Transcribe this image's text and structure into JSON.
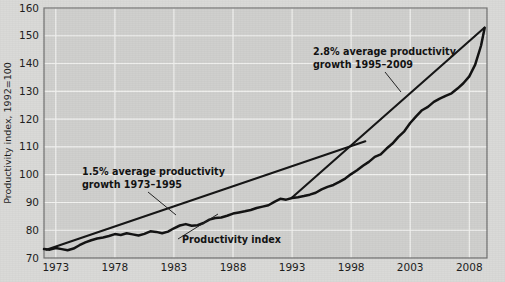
{
  "figure": {
    "background_color": "#d5d5d3",
    "plot_background_color": "#cfcfcd",
    "gridline_color": "#f2f2f0",
    "border_color": "#6f6f6f",
    "line_color": "#111111"
  },
  "axis": {
    "y_title": "Productivity index, 1992=100",
    "y_ticks": [
      "70",
      "80",
      "90",
      "100",
      "110",
      "120",
      "130",
      "140",
      "150",
      "160"
    ],
    "x_ticks": [
      "1973",
      "1978",
      "1983",
      "1988",
      "1993",
      "1998",
      "2003",
      "2008"
    ]
  },
  "annotations": {
    "trend1_line1": "1.5% average productivity",
    "trend1_line2": "growth 1973–1995",
    "trend2_line1": "2.8% average productivity",
    "trend2_line2": "growth 1995–2009",
    "series_label": "Productivity index"
  },
  "chart_data": {
    "type": "line",
    "title": "",
    "xlabel": "",
    "ylabel": "Productivity index, 1992=100",
    "xlim": [
      1972,
      2009.5
    ],
    "ylim": [
      70,
      160
    ],
    "ytick_values": [
      70,
      80,
      90,
      100,
      110,
      120,
      130,
      140,
      150,
      160
    ],
    "xtick_values": [
      1973,
      1978,
      1983,
      1988,
      1993,
      1998,
      2003,
      2008
    ],
    "grid": true,
    "legend_position": "none",
    "series": [
      {
        "name": "Productivity index",
        "type": "line",
        "x": [
          1972,
          1972.5,
          1973,
          1973.5,
          1974,
          1974.5,
          1975,
          1975.5,
          1976,
          1976.5,
          1977,
          1977.5,
          1978,
          1978.5,
          1979,
          1979.5,
          1980,
          1980.5,
          1981,
          1981.5,
          1982,
          1982.5,
          1983,
          1983.5,
          1984,
          1984.5,
          1985,
          1985.5,
          1986,
          1986.5,
          1987,
          1987.5,
          1988,
          1988.5,
          1989,
          1989.5,
          1990,
          1990.5,
          1991,
          1991.5,
          1992,
          1992.5,
          1993,
          1993.5,
          1994,
          1994.5,
          1995,
          1995.5,
          1996,
          1996.5,
          1997,
          1997.5,
          1998,
          1998.5,
          1999,
          1999.5,
          2000,
          2000.5,
          2001,
          2001.5,
          2002,
          2002.5,
          2003,
          2003.5,
          2004,
          2004.5,
          2005,
          2005.5,
          2006,
          2006.5,
          2007,
          2007.5,
          2008,
          2008.5,
          2009,
          2009.3
        ],
        "y": [
          73.2,
          73.0,
          73.6,
          73.2,
          72.8,
          73.4,
          74.6,
          75.6,
          76.4,
          77.0,
          77.4,
          77.9,
          78.6,
          78.3,
          78.9,
          78.5,
          78.1,
          78.7,
          79.6,
          79.4,
          78.9,
          79.5,
          80.7,
          81.7,
          82.2,
          81.6,
          81.8,
          82.6,
          83.8,
          84.4,
          84.6,
          85.2,
          86.0,
          86.4,
          86.8,
          87.3,
          88.0,
          88.5,
          89.0,
          90.2,
          91.3,
          91.0,
          91.6,
          91.9,
          92.3,
          92.8,
          93.5,
          94.7,
          95.6,
          96.3,
          97.4,
          98.6,
          100.2,
          101.6,
          103.2,
          104.6,
          106.4,
          107.3,
          109.4,
          111.2,
          113.6,
          115.6,
          118.6,
          121.0,
          123.2,
          124.4,
          126.2,
          127.4,
          128.4,
          129.3,
          131.0,
          132.9,
          135.4,
          139.6,
          146.5,
          152.8
        ]
      },
      {
        "name": "1.5% trend 1973–1995",
        "type": "line",
        "x": [
          1972.2,
          1999.2
        ],
        "y": [
          73.0,
          112.0
        ]
      },
      {
        "name": "2.8% trend 1995–2009",
        "type": "line",
        "x": [
          1993.0,
          2009.3
        ],
        "y": [
          91.8,
          153.0
        ]
      }
    ],
    "annotations": [
      {
        "text": "1.5% average productivity growth 1973–1995",
        "x": 1980.0,
        "y": 101.0
      },
      {
        "text": "2.8% average productivity growth 1995–2009",
        "x": 1997.5,
        "y": 145.0
      },
      {
        "text": "Productivity index",
        "x": 1988.0,
        "y": 75.5
      }
    ]
  }
}
